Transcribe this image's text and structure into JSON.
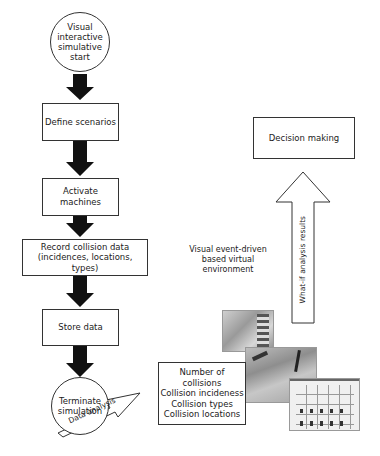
{
  "flow": {
    "start": "Visual interactive simulative start",
    "start_lines": [
      "Visual",
      "interactive",
      "simulative",
      "start"
    ],
    "step1": "Define scenarios",
    "step2": "Activate machines",
    "step3_line1": "Record collision data",
    "step3_line2": "(incidences, locations, types)",
    "step4": "Store data",
    "end_line1": "Terminate",
    "end_line2": "simulation"
  },
  "analysis_arrow": "Data analysis",
  "results_box": {
    "lines": [
      "Number of collisions",
      "Collision incideness",
      "Collision types",
      "Collision locations"
    ]
  },
  "environment_label": {
    "lines": [
      "Visual event-driven",
      "based virtual",
      "environment"
    ]
  },
  "whatif_arrow": "What-if analysis results",
  "decision_box": "Decision making",
  "colors": {
    "arrow_fill": "#111111",
    "border": "#333333",
    "background": "#ffffff"
  }
}
